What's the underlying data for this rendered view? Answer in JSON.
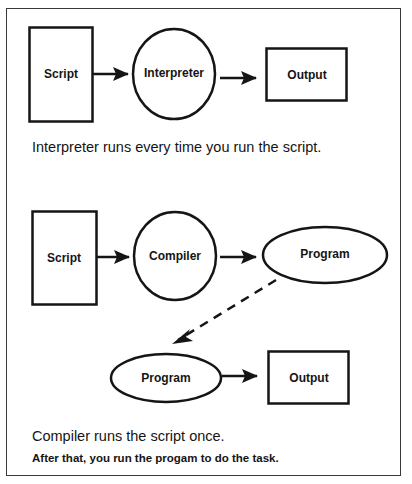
{
  "diagram": {
    "interpreter_flow": {
      "nodes": [
        {
          "id": "script",
          "shape": "rectangle",
          "label": "Script"
        },
        {
          "id": "interpreter",
          "shape": "circle",
          "label": "Interpreter"
        },
        {
          "id": "output",
          "shape": "rectangle",
          "label": "Output"
        }
      ],
      "edges": [
        {
          "from": "script",
          "to": "interpreter",
          "style": "solid"
        },
        {
          "from": "interpreter",
          "to": "output",
          "style": "solid"
        }
      ],
      "caption": "Interpreter runs every time you run the script."
    },
    "compiler_flow": {
      "nodes": [
        {
          "id": "script",
          "shape": "rectangle",
          "label": "Script"
        },
        {
          "id": "compiler",
          "shape": "circle",
          "label": "Compiler"
        },
        {
          "id": "program_1",
          "shape": "ellipse",
          "label": "Program"
        },
        {
          "id": "program_2",
          "shape": "ellipse",
          "label": "Program"
        },
        {
          "id": "output",
          "shape": "rectangle",
          "label": "Output"
        }
      ],
      "edges": [
        {
          "from": "script",
          "to": "compiler",
          "style": "solid"
        },
        {
          "from": "compiler",
          "to": "program_1",
          "style": "solid"
        },
        {
          "from": "program_1",
          "to": "program_2",
          "style": "dashed"
        },
        {
          "from": "program_2",
          "to": "output",
          "style": "solid"
        }
      ],
      "caption": "Compiler runs the script once.",
      "caption_bold": "After that, you run the progam to do the task."
    }
  },
  "colors": {
    "stroke": "#151515",
    "frame": "#3a3a3a",
    "background": "#ffffff"
  }
}
